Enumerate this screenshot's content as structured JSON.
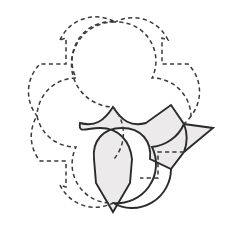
{
  "figure": {
    "title": "Interlocking notched-circle tessellation",
    "canvas": {
      "width": 227,
      "height": 225,
      "background": "#ffffff"
    },
    "colors": {
      "background": "#ffffff",
      "dashed_stroke": "#3a3a3a",
      "solid_stroke": "#2b2b2b",
      "shaded_fill": "#eceaea"
    },
    "stroke": {
      "dashed_width": 1.5,
      "dash_pattern": "4.2 3.2",
      "solid_width": 1.9
    }
  },
  "geometry": {
    "circle_radius": 39,
    "grid": "2x2",
    "notch_size": 26,
    "petal_tip_offset": 19,
    "centers": {
      "top_left": [
        76,
        78
      ],
      "top_right": [
        152,
        78
      ],
      "bottom_left": [
        76,
        147
      ],
      "bottom_right": [
        152,
        147
      ]
    },
    "tips": {
      "top": [
        115,
        22
      ],
      "left": [
        37,
        116
      ],
      "right": [
        213,
        128
      ],
      "bottom": [
        113,
        212
      ]
    }
  },
  "units": [
    {
      "name": "top-left-unit",
      "style": "dashed",
      "filled": false,
      "notch_corner": "upper-left",
      "path": "M 76 39 A 39 39 0 1 1 47.4 105.4 L 47.4 78 L 63.5 78 L 63.5 45.8 L 76 45.8 Z"
    },
    {
      "name": "top-right-unit",
      "style": "dashed",
      "filled": false,
      "notch_corner": "upper-right",
      "path": "M 152 39 A 39 39 0 1 0 180.6 105.4 L 180.6 78 L 164.5 78 L 164.5 45.8 L 152 45.8 Z"
    },
    {
      "name": "bottom-left-unit",
      "style": "dashed",
      "filled": false,
      "notch_corner": "lower-left",
      "path": "M 76 186 A 39 39 0 1 0 47.4 119.6 L 47.4 147 L 63.5 147 L 63.5 179.2 L 76 179.2 Z"
    },
    {
      "name": "bottom-right-unit-shaded",
      "style": "solid",
      "filled": true,
      "notch_corner": "lower-right",
      "path": "M 152 186 A 39 39 0 1 1 180.6 119.6 L 180.6 147 L 164.5 147 L 164.5 179.2 L 152 179.2 Z"
    }
  ],
  "shaded_region": {
    "name": "shaded-tile",
    "fill": "#eceaea",
    "stroke": "#2b2b2b",
    "description": "Four-pointed concave tile formed by the bottom-right unit overlapping its neighbours"
  }
}
